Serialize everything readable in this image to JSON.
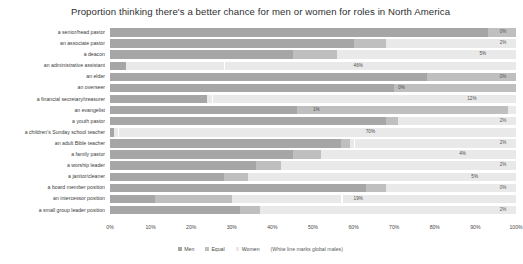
{
  "chart_data": {
    "type": "bar",
    "subtype": "stacked-horizontal-100pct",
    "title": "Proportion thinking there's a better chance for men or women for roles in North America",
    "xlabel": "",
    "ylabel": "",
    "xlim": [
      0,
      100
    ],
    "xticks": [
      "0%",
      "10%",
      "20%",
      "30%",
      "40%",
      "50%",
      "60%",
      "70%",
      "80%",
      "90%",
      "100%"
    ],
    "xtick_values": [
      0,
      10,
      20,
      30,
      40,
      50,
      60,
      70,
      80,
      90,
      100
    ],
    "grid": false,
    "legend_position": "bottom",
    "legend": [
      "Men",
      "Equal",
      "Women"
    ],
    "legend_note": "(White line marks global males)",
    "colors": {
      "men": "#a6a6a6",
      "equal": "#bfbfbf",
      "women": "#e9e9e9",
      "marker": "#ffffff"
    },
    "categories": [
      "a senior/head pastor",
      "an associate pastor",
      "a deacon",
      "an administrative assistant",
      "an elder",
      "an overseer",
      "a financial secretary/treasurer",
      "an evangelist",
      "a youth pastor",
      "a children's Sunday school teacher",
      "an adult Bible teacher",
      "a family pastor",
      "a worship leader",
      "a janitor/cleaner",
      "a board member position",
      "an intercessor position",
      "a small group leader position"
    ],
    "series": [
      {
        "name": "Men",
        "values": [
          93,
          60,
          45,
          4,
          78,
          70,
          24,
          46,
          68,
          1,
          57,
          45,
          36,
          28,
          63,
          11,
          32
        ]
      },
      {
        "name": "Equal",
        "values": [
          7,
          8,
          11,
          0,
          22,
          30,
          0,
          52,
          3,
          0,
          2,
          7,
          6,
          6,
          5,
          19,
          5
        ]
      },
      {
        "name": "Women",
        "values": [
          0,
          32,
          44,
          96,
          0,
          0,
          76,
          2,
          29,
          99,
          41,
          48,
          58,
          66,
          32,
          70,
          63
        ]
      }
    ],
    "marker_values": [
      null,
      null,
      null,
      28,
      null,
      null,
      25,
      null,
      null,
      2,
      60,
      null,
      null,
      null,
      null,
      57,
      null
    ],
    "value_labels": [
      {
        "text": "0%",
        "at": 96,
        "inside": false
      },
      {
        "text": "2%",
        "at": 96,
        "inside": false
      },
      {
        "text": "5%",
        "at": 91,
        "inside": true
      },
      {
        "text": "46%",
        "at": 60,
        "inside": true
      },
      {
        "text": "0%",
        "at": 96,
        "inside": false
      },
      {
        "text": "0%",
        "at": 71,
        "inside": true
      },
      {
        "text": "12%",
        "at": 88,
        "inside": true
      },
      {
        "text": "1%",
        "at": 50,
        "inside": true
      },
      {
        "text": "2%",
        "at": 96,
        "inside": false
      },
      {
        "text": "70%",
        "at": 63,
        "inside": true
      },
      {
        "text": "2%",
        "at": 96,
        "inside": false
      },
      {
        "text": "4%",
        "at": 86,
        "inside": true
      },
      {
        "text": "2%",
        "at": 96,
        "inside": false
      },
      {
        "text": "5%",
        "at": 89,
        "inside": true
      },
      {
        "text": "0%",
        "at": 96,
        "inside": false
      },
      {
        "text": "19%",
        "at": 60,
        "inside": true
      },
      {
        "text": "2%",
        "at": 96,
        "inside": false
      }
    ]
  }
}
